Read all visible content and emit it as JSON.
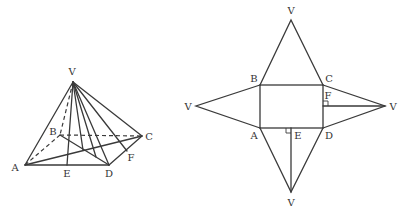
{
  "pyramid": {
    "labels": {
      "V": "V",
      "A": "A",
      "B": "B",
      "C": "C",
      "D": "D",
      "E": "E",
      "F": "F"
    }
  },
  "net": {
    "labels": {
      "V_top": "V",
      "V_left": "V",
      "V_right": "V",
      "V_bottom": "V",
      "A": "A",
      "B": "B",
      "C": "C",
      "D": "D",
      "E": "E",
      "F": "F"
    }
  }
}
